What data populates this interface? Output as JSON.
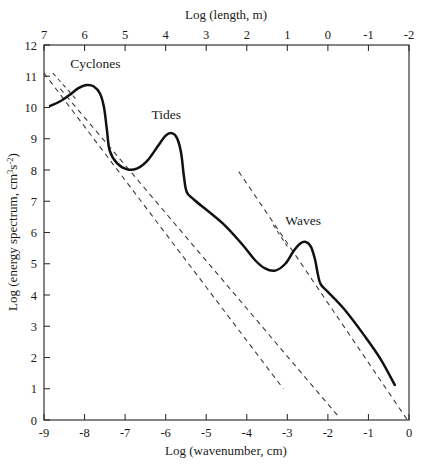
{
  "chart_data": {
    "type": "line",
    "title": "",
    "xlabel": "Log (wavenumber, cm)",
    "xlabel_top": "Log (length, m)",
    "ylabel": "Log (energy spectrum, cm",
    "ylabel_sup_a": "3",
    "ylabel_mid": "s",
    "ylabel_sup_b": "-2",
    "ylabel_end": ")",
    "xlim": [
      -9,
      0
    ],
    "ylim": [
      0,
      12
    ],
    "xticks": [
      "-9",
      "-8",
      "-7",
      "-6",
      "-5",
      "-4",
      "-3",
      "-2",
      "-1",
      "0"
    ],
    "xtick_values": [
      -9,
      -8,
      -7,
      -6,
      -5,
      -4,
      -3,
      -2,
      -1,
      0
    ],
    "xticks_top": [
      "7",
      "6",
      "5",
      "4",
      "3",
      "2",
      "1",
      "0",
      "-1",
      "-2"
    ],
    "xtick_top_values": [
      7,
      6,
      5,
      4,
      3,
      2,
      1,
      0,
      -1,
      -2
    ],
    "yticks": [
      "0",
      "1",
      "2",
      "3",
      "4",
      "5",
      "6",
      "7",
      "8",
      "9",
      "10",
      "11",
      "12"
    ],
    "ytick_values": [
      0,
      1,
      2,
      3,
      4,
      5,
      6,
      7,
      8,
      9,
      10,
      11,
      12
    ],
    "grid": false,
    "legend": "none",
    "series": [
      {
        "name": "ocean energy spectrum",
        "style": "solid",
        "points": [
          [
            -8.85,
            10.05
          ],
          [
            -8.6,
            10.2
          ],
          [
            -8.35,
            10.42
          ],
          [
            -8.15,
            10.62
          ],
          [
            -7.95,
            10.72
          ],
          [
            -7.78,
            10.68
          ],
          [
            -7.62,
            10.45
          ],
          [
            -7.52,
            10.0
          ],
          [
            -7.45,
            9.3
          ],
          [
            -7.38,
            8.62
          ],
          [
            -7.2,
            8.22
          ],
          [
            -6.95,
            8.02
          ],
          [
            -6.7,
            8.05
          ],
          [
            -6.45,
            8.3
          ],
          [
            -6.2,
            8.75
          ],
          [
            -6.0,
            9.1
          ],
          [
            -5.85,
            9.18
          ],
          [
            -5.72,
            9.02
          ],
          [
            -5.62,
            8.55
          ],
          [
            -5.55,
            7.8
          ],
          [
            -5.48,
            7.3
          ],
          [
            -5.3,
            7.05
          ],
          [
            -4.6,
            6.3
          ],
          [
            -4.1,
            5.6
          ],
          [
            -3.8,
            5.12
          ],
          [
            -3.55,
            4.85
          ],
          [
            -3.3,
            4.78
          ],
          [
            -3.05,
            5.0
          ],
          [
            -2.85,
            5.4
          ],
          [
            -2.68,
            5.65
          ],
          [
            -2.55,
            5.7
          ],
          [
            -2.42,
            5.55
          ],
          [
            -2.32,
            5.15
          ],
          [
            -2.25,
            4.68
          ],
          [
            -2.18,
            4.35
          ],
          [
            -2.0,
            4.1
          ],
          [
            -1.6,
            3.55
          ],
          [
            -1.1,
            2.7
          ],
          [
            -0.7,
            1.95
          ],
          [
            -0.35,
            1.12
          ]
        ]
      }
    ],
    "slope_guides": [
      {
        "name": "upper-slope-guide",
        "x1": -9.0,
        "y1": 11.1,
        "x2": -3.1,
        "y2": 1.0
      },
      {
        "name": "middle-slope-guide",
        "x1": -8.6,
        "y1": 10.6,
        "x2": -1.7,
        "y2": 0.05
      },
      {
        "name": "lower-slope-guide",
        "x1": -4.2,
        "y1": 7.95,
        "x2": -0.05,
        "y2": 0.02
      }
    ],
    "annotations": [
      {
        "name": "cyclones",
        "text": "Cyclones",
        "x": -8.35,
        "y": 11.25,
        "leader": {
          "x1": -8.78,
          "y1": 11.1,
          "x2": -8.2,
          "y2": 10.25
        }
      },
      {
        "name": "tides",
        "text": "Tides",
        "x": -6.35,
        "y": 9.62,
        "leader": null
      },
      {
        "name": "waves",
        "text": "Waves",
        "x": -3.05,
        "y": 6.25,
        "leader": {
          "x1": -3.35,
          "y1": 6.25,
          "x2": -3.0,
          "y2": 5.55
        }
      }
    ],
    "colors": {
      "curve": "#111111",
      "guide": "#3b3b3b",
      "axis": "#2a2a2a",
      "background": "#ffffff"
    }
  }
}
